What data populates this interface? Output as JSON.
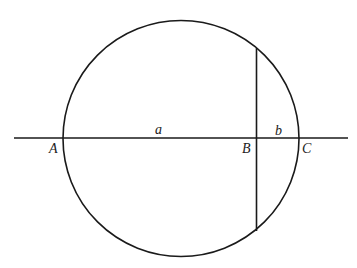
{
  "diagram": {
    "type": "geometry",
    "labels": {
      "point_a": "A",
      "point_b": "B",
      "point_c": "C",
      "segment_a": "a",
      "segment_b": "b"
    },
    "colors": {
      "stroke": "#1a1a1a",
      "background": "#ffffff"
    }
  }
}
